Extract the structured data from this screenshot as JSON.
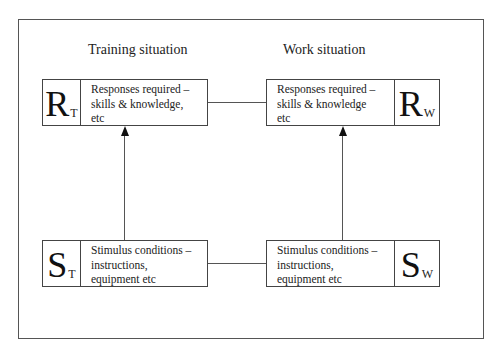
{
  "diagram": {
    "headings": {
      "training": "Training situation",
      "work": "Work situation"
    },
    "boxes": {
      "response_training": {
        "symbol": "R",
        "subscript": "T",
        "lines": [
          "Responses required –",
          "skills & knowledge,",
          "etc"
        ]
      },
      "response_work": {
        "symbol": "R",
        "subscript": "W",
        "lines": [
          "Responses required –",
          "skills & knowledge",
          "etc"
        ]
      },
      "stimulus_training": {
        "symbol": "S",
        "subscript": "T",
        "lines": [
          "Stimulus conditions –",
          "instructions,",
          "equipment etc"
        ]
      },
      "stimulus_work": {
        "symbol": "S",
        "subscript": "W",
        "lines": [
          "Stimulus conditions –",
          "instructions,",
          "equipment etc"
        ]
      }
    },
    "connections": [
      {
        "from": "stimulus_training",
        "to": "response_training",
        "type": "arrow"
      },
      {
        "from": "stimulus_work",
        "to": "response_work",
        "type": "arrow"
      },
      {
        "from": "response_training",
        "to": "response_work",
        "type": "line"
      },
      {
        "from": "stimulus_training",
        "to": "stimulus_work",
        "type": "line"
      }
    ],
    "colors": {
      "line": "#555555",
      "text": "#222222",
      "background": "#ffffff"
    }
  }
}
